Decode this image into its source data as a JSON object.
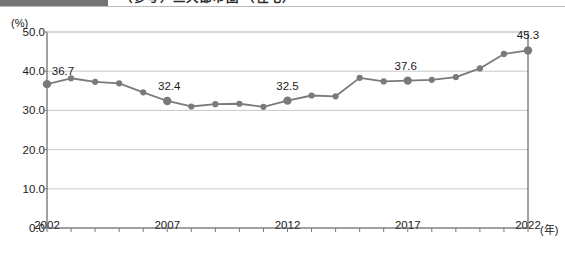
{
  "header": {
    "swatch_color": "#757575",
    "title": "（参考）三大都市圏 （住宅）"
  },
  "chart_data": {
    "type": "line",
    "title": "",
    "subtitle": "",
    "xlabel": "(年)",
    "ylabel": "(%)",
    "ylim": [
      0.0,
      50.0
    ],
    "xlim": [
      2002,
      2022
    ],
    "grid": true,
    "legend": false,
    "y_ticks": [
      "50.0",
      "40.0",
      "30.0",
      "20.0",
      "10.0",
      "0.0"
    ],
    "y_tick_values": [
      50.0,
      40.0,
      30.0,
      20.0,
      10.0,
      0.0
    ],
    "x_ticks": [
      "2002",
      "2007",
      "2012",
      "2017",
      "2022"
    ],
    "x_tick_values": [
      2002,
      2007,
      2012,
      2017,
      2022
    ],
    "series_color": "#7a7a7a",
    "marker": "circle",
    "x": [
      2002,
      2003,
      2004,
      2005,
      2006,
      2007,
      2008,
      2009,
      2010,
      2011,
      2012,
      2013,
      2014,
      2015,
      2016,
      2017,
      2018,
      2019,
      2020,
      2021,
      2022
    ],
    "values": [
      36.7,
      38.2,
      37.3,
      36.9,
      34.6,
      32.4,
      31.0,
      31.6,
      31.7,
      30.9,
      32.5,
      33.8,
      33.6,
      38.3,
      37.4,
      37.6,
      37.8,
      38.5,
      40.7,
      44.4,
      45.3
    ],
    "point_labels": [
      {
        "x": 2002,
        "value": 36.7,
        "text": "36.7"
      },
      {
        "x": 2007,
        "value": 32.4,
        "text": "32.4"
      },
      {
        "x": 2012,
        "value": 32.5,
        "text": "32.5"
      },
      {
        "x": 2017,
        "value": 37.6,
        "text": "37.6"
      },
      {
        "x": 2022,
        "value": 45.3,
        "text": "45.3"
      }
    ],
    "highlighted_points": [
      2002,
      2007,
      2012,
      2017,
      2022
    ]
  }
}
